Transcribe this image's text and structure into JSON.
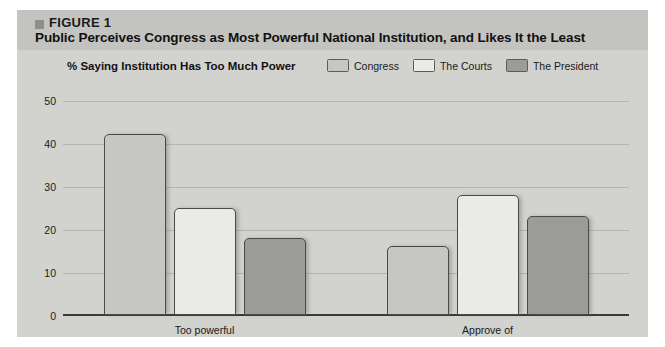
{
  "figure": {
    "marker_icon": "square-marker-icon",
    "label": "FIGURE 1",
    "title": "Public Perceives Congress as Most Powerful National Institution, and Likes It the Least"
  },
  "chart_data": {
    "type": "bar",
    "title": "Public Perceives Congress as Most Powerful National Institution, and Likes It the Least",
    "subtitle": "% Saying Institution Has Too Much Power",
    "xlabel": "",
    "ylabel": "",
    "categories": [
      "Too powerful",
      "Approve of"
    ],
    "series": [
      {
        "name": "Congress",
        "values": [
          42,
          16
        ],
        "color": "#c6c6c3"
      },
      {
        "name": "The Courts",
        "values": [
          25,
          28
        ],
        "color": "#eaeae7"
      },
      {
        "name": "The President",
        "values": [
          18,
          23
        ],
        "color": "#9b9b98"
      }
    ],
    "ylim": [
      0,
      50
    ],
    "yticks": [
      0,
      10,
      20,
      30,
      40,
      50
    ],
    "grid": true,
    "legend_position": "top-right"
  },
  "colors": {
    "page_background": "#ffffff",
    "panel_background": "#d2d2cf",
    "header_background": "#c3c3c0",
    "bar_outline": "#4a4a48",
    "gridline": "#b4b4b1",
    "axis": "#3a3a38"
  }
}
